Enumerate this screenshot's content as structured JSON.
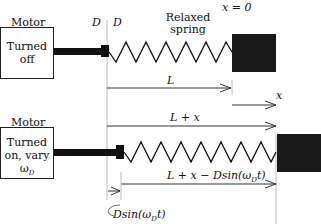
{
  "top": {
    "motor_label": "Motor",
    "motor_state": "Turned off",
    "d_left": "D",
    "d_right": "D",
    "spring_label_line1": "Relaxed",
    "spring_label_line2": "spring",
    "origin_label": "x = 0",
    "length_label": "L",
    "x_label": "x"
  },
  "bottom": {
    "motor_label": "Motor",
    "motor_state_line1": "Turned",
    "motor_state_line2": "on, vary",
    "motor_state_line3": "ω",
    "motor_state_sub": "D",
    "length_plus_x_label": "L + x",
    "stretch_label": "L + x − Dsin(ω",
    "stretch_label_sub": "D",
    "stretch_label_end": "t)",
    "displacement_label": "Dsin(ω",
    "displacement_sub": "D",
    "displacement_end": "t)"
  },
  "colors": {
    "ink": "#111111",
    "guide": "#bbbbbb",
    "mass": "#1a1a1a"
  }
}
